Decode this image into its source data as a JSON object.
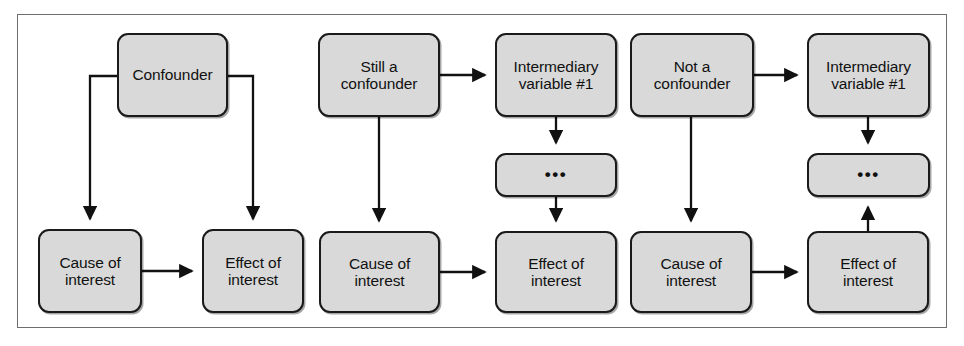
{
  "figure": {
    "kind": "causal-diagram",
    "panel_count": 3,
    "frame_color": "#6e6e6e",
    "node_fill": "#d9d9d9",
    "node_stroke": "#1a1a1a",
    "arrow_color": "#111111"
  },
  "panels": [
    {
      "id": "panel-confounder",
      "name": "confounder",
      "nodes": [
        {
          "id": "confounder",
          "label": "Confounder",
          "x": 117,
          "y": 33,
          "w": 111,
          "h": 84
        },
        {
          "id": "cause",
          "label": "Cause of\ninterest",
          "x": 38,
          "y": 229,
          "w": 104,
          "h": 84
        },
        {
          "id": "effect",
          "label": "Effect of\ninterest",
          "x": 202,
          "y": 229,
          "w": 102,
          "h": 84
        }
      ],
      "edges": [
        {
          "from": "confounder",
          "to": "cause",
          "shape": "elbow-left",
          "direction": "down"
        },
        {
          "from": "confounder",
          "to": "effect",
          "shape": "elbow-right",
          "direction": "down"
        },
        {
          "from": "cause",
          "to": "effect",
          "shape": "straight",
          "direction": "right"
        }
      ]
    },
    {
      "id": "panel-still-a-confounder",
      "name": "still-a-confounder",
      "nodes": [
        {
          "id": "still",
          "label": "Still a\nconfounder",
          "x": 318,
          "y": 33,
          "w": 122,
          "h": 84
        },
        {
          "id": "intermediary",
          "label": "Intermediary\nvariable #1",
          "x": 495,
          "y": 33,
          "w": 122,
          "h": 84
        },
        {
          "id": "ellipsis",
          "label": "•••",
          "x": 495,
          "y": 153,
          "w": 122,
          "h": 44
        },
        {
          "id": "cause",
          "label": "Cause of\ninterest",
          "x": 319,
          "y": 231,
          "w": 121,
          "h": 82
        },
        {
          "id": "effect",
          "label": "Effect of\ninterest",
          "x": 495,
          "y": 231,
          "w": 122,
          "h": 82
        }
      ],
      "edges": [
        {
          "from": "still",
          "to": "intermediary",
          "shape": "straight",
          "direction": "right"
        },
        {
          "from": "still",
          "to": "cause",
          "shape": "straight",
          "direction": "down"
        },
        {
          "from": "intermediary",
          "to": "ellipsis",
          "shape": "straight",
          "direction": "down"
        },
        {
          "from": "ellipsis",
          "to": "effect",
          "shape": "straight",
          "direction": "down"
        },
        {
          "from": "cause",
          "to": "effect",
          "shape": "straight",
          "direction": "right"
        }
      ]
    },
    {
      "id": "panel-not-a-confounder",
      "name": "not-a-confounder",
      "nodes": [
        {
          "id": "nota",
          "label": "Not a\nconfounder",
          "x": 630,
          "y": 33,
          "w": 124,
          "h": 84
        },
        {
          "id": "intermediary",
          "label": "Intermediary\nvariable #1",
          "x": 807,
          "y": 33,
          "w": 123,
          "h": 84
        },
        {
          "id": "ellipsis",
          "label": "•••",
          "x": 807,
          "y": 153,
          "w": 123,
          "h": 44
        },
        {
          "id": "cause",
          "label": "Cause of\ninterest",
          "x": 630,
          "y": 231,
          "w": 122,
          "h": 82
        },
        {
          "id": "effect",
          "label": "Effect of\ninterest",
          "x": 807,
          "y": 231,
          "w": 122,
          "h": 82
        }
      ],
      "edges": [
        {
          "from": "nota",
          "to": "intermediary",
          "shape": "straight",
          "direction": "right"
        },
        {
          "from": "nota",
          "to": "cause",
          "shape": "straight",
          "direction": "down"
        },
        {
          "from": "intermediary",
          "to": "ellipsis",
          "shape": "straight",
          "direction": "down"
        },
        {
          "from": "effect",
          "to": "ellipsis",
          "shape": "straight",
          "direction": "up"
        },
        {
          "from": "cause",
          "to": "effect",
          "shape": "straight",
          "direction": "right"
        }
      ]
    }
  ],
  "labels": {
    "confounder": "Confounder",
    "still_a_confounder": "Still a\nconfounder",
    "not_a_confounder": "Not a\nconfounder",
    "intermediary_variable_1": "Intermediary\nvariable #1",
    "ellipsis": "•••",
    "cause_of_interest": "Cause of\ninterest",
    "effect_of_interest": "Effect of\ninterest"
  }
}
